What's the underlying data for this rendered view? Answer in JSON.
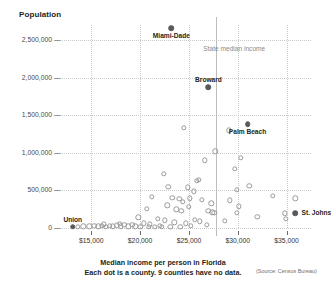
{
  "chart_data": {
    "type": "scatter",
    "title": "Median income per person in Florida",
    "subtitle": "Each dot is a county. 9 counties have no data.",
    "source": "(Source: Census Bureau)",
    "ylabel": "Population",
    "xlabel": "",
    "xlim": [
      12000,
      37500
    ],
    "ylim": [
      0,
      2700000
    ],
    "grid": true,
    "legend": false,
    "xticks": [
      {
        "value": 15000,
        "label": "$15,000"
      },
      {
        "value": 20000,
        "label": "$20,000"
      },
      {
        "value": 25000,
        "label": "$25,000"
      },
      {
        "value": 30000,
        "label": "$30,000"
      },
      {
        "value": 35000,
        "label": "$35,000"
      }
    ],
    "yticks": [
      {
        "value": 0,
        "label": "0"
      },
      {
        "value": 500000,
        "label": "500,000"
      },
      {
        "value": 1000000,
        "label": "1,000,000"
      },
      {
        "value": 1500000,
        "label": "1,500,000"
      },
      {
        "value": 2000000,
        "label": "2,000,000"
      },
      {
        "value": 2500000,
        "label": "2,500,000"
      }
    ],
    "annotations": [
      {
        "name": "state-median-income",
        "label": "State median income",
        "x": 27800,
        "type": "vline"
      }
    ],
    "points": [
      {
        "label": "Miami-Dade",
        "x": 23200,
        "y": 2660000,
        "highlight": true,
        "label_pos": "below"
      },
      {
        "label": "Broward",
        "x": 27000,
        "y": 1870000,
        "highlight": true,
        "label_pos": "above"
      },
      {
        "label": "Palm Beach",
        "x": 31000,
        "y": 1380000,
        "highlight": true,
        "label_pos": "below"
      },
      {
        "label": "St. Johns",
        "x": 35900,
        "y": 200000,
        "highlight": true,
        "label_pos": "right"
      },
      {
        "label": "Union",
        "x": 13100,
        "y": 15000,
        "highlight": true,
        "label_pos": "above"
      },
      {
        "label": "",
        "x": 24500,
        "y": 1330000,
        "highlight": false
      },
      {
        "label": "",
        "x": 29100,
        "y": 1300000,
        "highlight": false
      },
      {
        "label": "",
        "x": 27700,
        "y": 1020000,
        "highlight": false
      },
      {
        "label": "",
        "x": 30300,
        "y": 930000,
        "highlight": false
      },
      {
        "label": "",
        "x": 26600,
        "y": 900000,
        "highlight": false
      },
      {
        "label": "",
        "x": 29700,
        "y": 790000,
        "highlight": false
      },
      {
        "label": "",
        "x": 22400,
        "y": 720000,
        "highlight": false
      },
      {
        "label": "",
        "x": 26000,
        "y": 640000,
        "highlight": false
      },
      {
        "label": "",
        "x": 25800,
        "y": 625000,
        "highlight": false
      },
      {
        "label": "",
        "x": 31200,
        "y": 560000,
        "highlight": false
      },
      {
        "label": "",
        "x": 22900,
        "y": 545000,
        "highlight": false
      },
      {
        "label": "",
        "x": 24900,
        "y": 540000,
        "highlight": false
      },
      {
        "label": "",
        "x": 29900,
        "y": 505000,
        "highlight": false
      },
      {
        "label": "",
        "x": 25500,
        "y": 490000,
        "highlight": false
      },
      {
        "label": "",
        "x": 33600,
        "y": 430000,
        "highlight": false
      },
      {
        "label": "",
        "x": 21200,
        "y": 415000,
        "highlight": false
      },
      {
        "label": "",
        "x": 23300,
        "y": 400000,
        "highlight": false
      },
      {
        "label": "",
        "x": 25100,
        "y": 395000,
        "highlight": false
      },
      {
        "label": "",
        "x": 24000,
        "y": 390000,
        "highlight": false
      },
      {
        "label": "",
        "x": 35900,
        "y": 395000,
        "highlight": false
      },
      {
        "label": "",
        "x": 26300,
        "y": 375000,
        "highlight": false
      },
      {
        "label": "",
        "x": 29200,
        "y": 370000,
        "highlight": false
      },
      {
        "label": "",
        "x": 24400,
        "y": 345000,
        "highlight": false
      },
      {
        "label": "",
        "x": 27300,
        "y": 330000,
        "highlight": false
      },
      {
        "label": "",
        "x": 22800,
        "y": 300000,
        "highlight": false
      },
      {
        "label": "",
        "x": 25000,
        "y": 280000,
        "highlight": false
      },
      {
        "label": "",
        "x": 30100,
        "y": 290000,
        "highlight": false
      },
      {
        "label": "",
        "x": 20700,
        "y": 255000,
        "highlight": false
      },
      {
        "label": "",
        "x": 23700,
        "y": 250000,
        "highlight": false
      },
      {
        "label": "",
        "x": 24200,
        "y": 225000,
        "highlight": false
      },
      {
        "label": "",
        "x": 27000,
        "y": 230000,
        "highlight": false
      },
      {
        "label": "",
        "x": 27400,
        "y": 210000,
        "highlight": false
      },
      {
        "label": "",
        "x": 27600,
        "y": 205000,
        "highlight": false
      },
      {
        "label": "",
        "x": 29900,
        "y": 205000,
        "highlight": false
      },
      {
        "label": "",
        "x": 34800,
        "y": 195000,
        "highlight": false
      },
      {
        "label": "",
        "x": 32000,
        "y": 150000,
        "highlight": false
      },
      {
        "label": "",
        "x": 34900,
        "y": 120000,
        "highlight": false
      },
      {
        "label": "",
        "x": 19800,
        "y": 140000,
        "highlight": false
      },
      {
        "label": "",
        "x": 21800,
        "y": 125000,
        "highlight": false
      },
      {
        "label": "",
        "x": 22500,
        "y": 100000,
        "highlight": false
      },
      {
        "label": "",
        "x": 25600,
        "y": 110000,
        "highlight": false
      },
      {
        "label": "",
        "x": 26100,
        "y": 90000,
        "highlight": false
      },
      {
        "label": "",
        "x": 28700,
        "y": 95000,
        "highlight": false
      },
      {
        "label": "",
        "x": 23500,
        "y": 75000,
        "highlight": false
      },
      {
        "label": "",
        "x": 24700,
        "y": 65000,
        "highlight": false
      },
      {
        "label": "",
        "x": 20400,
        "y": 60000,
        "highlight": false
      },
      {
        "label": "",
        "x": 21000,
        "y": 50000,
        "highlight": false
      },
      {
        "label": "",
        "x": 26800,
        "y": 40000,
        "highlight": false
      },
      {
        "label": "",
        "x": 14200,
        "y": 25000,
        "highlight": false
      },
      {
        "label": "",
        "x": 14800,
        "y": 22000,
        "highlight": false
      },
      {
        "label": "",
        "x": 15300,
        "y": 28000,
        "highlight": false
      },
      {
        "label": "",
        "x": 15700,
        "y": 20000,
        "highlight": false
      },
      {
        "label": "",
        "x": 16100,
        "y": 30000,
        "highlight": false
      },
      {
        "label": "",
        "x": 16500,
        "y": 18000,
        "highlight": false
      },
      {
        "label": "",
        "x": 16900,
        "y": 32000,
        "highlight": false
      },
      {
        "label": "",
        "x": 17200,
        "y": 20000,
        "highlight": false
      },
      {
        "label": "",
        "x": 17600,
        "y": 35000,
        "highlight": false
      },
      {
        "label": "",
        "x": 18000,
        "y": 22000,
        "highlight": false
      },
      {
        "label": "",
        "x": 18400,
        "y": 40000,
        "highlight": false
      },
      {
        "label": "",
        "x": 18800,
        "y": 25000,
        "highlight": false
      },
      {
        "label": "",
        "x": 19200,
        "y": 45000,
        "highlight": false
      },
      {
        "label": "",
        "x": 19500,
        "y": 20000,
        "highlight": false
      },
      {
        "label": "",
        "x": 20000,
        "y": 15000,
        "highlight": false
      },
      {
        "label": "",
        "x": 20900,
        "y": 18000,
        "highlight": false
      },
      {
        "label": "",
        "x": 21500,
        "y": 12000,
        "highlight": false
      },
      {
        "label": "",
        "x": 22000,
        "y": 30000,
        "highlight": false
      },
      {
        "label": "",
        "x": 22200,
        "y": 14000,
        "highlight": false
      },
      {
        "label": "",
        "x": 23100,
        "y": 16000,
        "highlight": false
      },
      {
        "label": "",
        "x": 24100,
        "y": 12000,
        "highlight": false
      },
      {
        "label": "",
        "x": 13600,
        "y": 18000,
        "highlight": false
      },
      {
        "label": "",
        "x": 16300,
        "y": 50000,
        "highlight": false
      },
      {
        "label": "",
        "x": 17900,
        "y": 55000,
        "highlight": false
      },
      {
        "label": "",
        "x": 25200,
        "y": 30000,
        "highlight": false
      }
    ]
  }
}
